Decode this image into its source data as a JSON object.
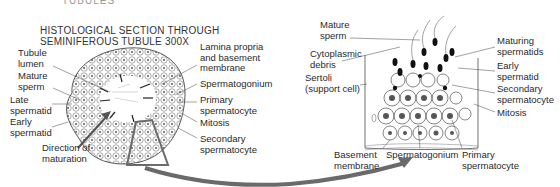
{
  "header": {
    "cut_text": "TUBULES",
    "title_line1": "HISTOLOGICAL SECTION THROUGH",
    "title_line2": "SEMINIFEROUS TUBULE 300X"
  },
  "left_diagram": {
    "labels": {
      "tubule_lumen": "Tubule\nlumen",
      "mature_sperm": "Mature\nsperm",
      "late_spermatid": "Late\nspermatid",
      "early_spermatid": "Early\nspermatid",
      "direction": "Direction of\nmaturation",
      "lamina": "Lamina propria\nand basement\nmembrane",
      "spermatogonium": "Spermatogonium",
      "primary": "Primary\nspermatocyte",
      "mitosis": "Mitosis",
      "secondary": "Secondary\nspermatocyte"
    }
  },
  "right_diagram": {
    "labels": {
      "mature_sperm": "Mature\nsperm",
      "cyto_debris": "Cytoplasmic\ndebris",
      "sertoli": "Sertoli\n(support cell)",
      "maturing": "Maturing\nspermatids",
      "early_spermatid": "Early\nspermatid",
      "secondary": "Secondary\nspermatocyte",
      "mitosis": "Mitosis",
      "basement": "Basement\nmembrane",
      "spermatogonium": "Spermatogonium",
      "primary": "Primary\nspermatocyte"
    }
  },
  "colors": {
    "ink": "#2a2a2a",
    "accent": "#6b6b6b",
    "arrow": "#6a6a6a"
  }
}
